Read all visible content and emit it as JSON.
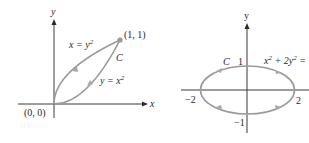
{
  "left_figure": {
    "axes": {
      "x_label": "x",
      "y_label": "y"
    },
    "origin_label": "(0, 0)",
    "endpoint_label": "(1, 1)",
    "curve_name": "C",
    "curves": [
      {
        "equation_lhs": "x = y",
        "equation_exp": "2",
        "description": "upper curve, traversed from (1,1) back to origin"
      },
      {
        "equation_lhs": "y = x",
        "equation_exp": "2",
        "description": "lower curve, traversed from origin to (1,1)"
      }
    ],
    "colors": {
      "curve": "#9a9a9a",
      "axis": "#3a3a3a",
      "text": "#2a2a2a"
    }
  },
  "right_figure": {
    "axes": {
      "y_label": "y"
    },
    "curve_name": "C",
    "equation_main": "x",
    "equation_exp1": "2",
    "equation_mid": " + 2y",
    "equation_exp2": "2",
    "equation_tail": " =",
    "ticks": {
      "x_neg": "−2",
      "x_pos": "2",
      "y_pos": "1",
      "y_neg": "−1"
    },
    "orientation": "counterclockwise",
    "colors": {
      "curve": "#9a9a9a",
      "axis": "#3a3a3a",
      "text": "#2a2a2a"
    }
  }
}
